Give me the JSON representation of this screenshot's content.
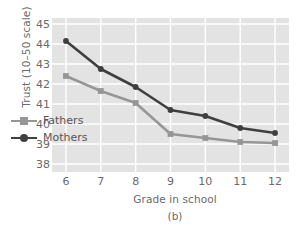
{
  "chart_data": {
    "type": "line",
    "title": "",
    "subtitle": "",
    "panel_label": "(b)",
    "xlabel": "Grade in school",
    "ylabel": "Trust (10–50 scale)",
    "categories": [
      6,
      7,
      8,
      9,
      10,
      11,
      12
    ],
    "x": [
      6,
      7,
      8,
      9,
      10,
      11,
      12
    ],
    "xtick_labels": [
      "6",
      "7",
      "8",
      "9",
      "10",
      "11",
      "12"
    ],
    "ytick_labels": [
      "38",
      "39",
      "40",
      "41",
      "42",
      "43",
      "44",
      "45"
    ],
    "ytick_values": [
      38,
      39,
      40,
      41,
      42,
      43,
      44,
      45
    ],
    "xlim": [
      5.6,
      12.4
    ],
    "ylim": [
      37.6,
      45.3
    ],
    "grid": true,
    "grid_color": "#ffffff",
    "plot_background": "#e3e3e3",
    "legend_position": "inside-lower-left",
    "series": [
      {
        "name": "Fathers",
        "color": "#969696",
        "marker": "square",
        "values": [
          42.4,
          41.65,
          41.05,
          39.5,
          39.3,
          39.1,
          39.05
        ]
      },
      {
        "name": "Mothers",
        "color": "#3f3f3f",
        "marker": "circle",
        "values": [
          44.15,
          42.75,
          41.85,
          40.7,
          40.4,
          39.8,
          39.55
        ]
      }
    ]
  },
  "legend": {
    "items": [
      {
        "label": "Fathers",
        "color": "#969696",
        "marker": "square"
      },
      {
        "label": "Mothers",
        "color": "#3f3f3f",
        "marker": "circle"
      }
    ]
  }
}
